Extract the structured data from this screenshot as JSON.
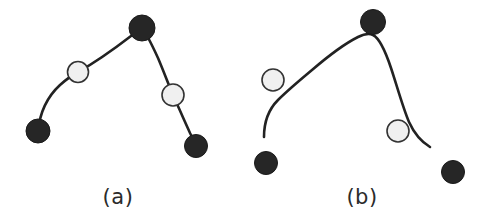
{
  "figure": {
    "width": 490,
    "height": 222,
    "background_color": "#ffffff",
    "curve_color": "#222222",
    "curve_width": 2.6,
    "marker_dark_fill": "#262626",
    "marker_dark_stroke": "#1a1a1a",
    "marker_light_fill": "#f0f0f0",
    "marker_light_stroke": "#333333",
    "marker_light_stroke_width": 1.6
  },
  "panels": [
    {
      "id": "a",
      "caption": "(a)",
      "caption_x": 118,
      "caption_y": 197,
      "curve_type": "interpolating",
      "curve_path": "M 38 131 C 40 112, 48 96, 60 85 C 68 78, 72 75, 78 72 C 96 62, 118 46, 131 36 C 136 32, 139 30, 142 28 C 147 34, 152 45, 158 58 C 164 72, 169 86, 173 95 C 178 106, 184 120, 190 133 C 193 139, 195 143, 196 146",
      "markers": [
        {
          "id": "a-p0",
          "label": "control-point-dark-lower-left",
          "type": "dark",
          "cx": 38,
          "cy": 131,
          "r": 12
        },
        {
          "id": "a-p1",
          "label": "control-point-light-left",
          "type": "light",
          "cx": 78,
          "cy": 72,
          "r": 10.5
        },
        {
          "id": "a-p2",
          "label": "control-point-dark-apex",
          "type": "dark",
          "cx": 142,
          "cy": 28,
          "r": 13
        },
        {
          "id": "a-p3",
          "label": "control-point-light-right",
          "type": "light",
          "cx": 173,
          "cy": 95,
          "r": 11
        },
        {
          "id": "a-p4",
          "label": "control-point-dark-lower-right",
          "type": "dark",
          "cx": 196,
          "cy": 146,
          "r": 11.5
        }
      ]
    },
    {
      "id": "b",
      "caption": "(b)",
      "caption_x": 362,
      "caption_y": 197,
      "curve_type": "approximating",
      "curve_path": "M 264 137 C 264 124, 268 110, 278 100 C 288 90, 300 80, 312 70 C 326 58, 344 44, 358 37 C 364 34, 369 33, 373 35 C 379 38, 385 50, 391 68 C 397 86, 403 108, 409 122 C 414 133, 420 141, 430 147",
      "markers": [
        {
          "id": "b-p0",
          "label": "control-point-dark-lower-left",
          "type": "dark",
          "cx": 266,
          "cy": 163,
          "r": 11.5
        },
        {
          "id": "b-p1",
          "label": "control-point-light-left",
          "type": "light",
          "cx": 273,
          "cy": 80,
          "r": 11
        },
        {
          "id": "b-p2",
          "label": "control-point-dark-apex",
          "type": "dark",
          "cx": 373,
          "cy": 22,
          "r": 12.5
        },
        {
          "id": "b-p3",
          "label": "control-point-light-right",
          "type": "light",
          "cx": 398,
          "cy": 131,
          "r": 11
        },
        {
          "id": "b-p4",
          "label": "control-point-dark-lower-right",
          "type": "dark",
          "cx": 453,
          "cy": 172,
          "r": 11.5
        }
      ]
    }
  ]
}
